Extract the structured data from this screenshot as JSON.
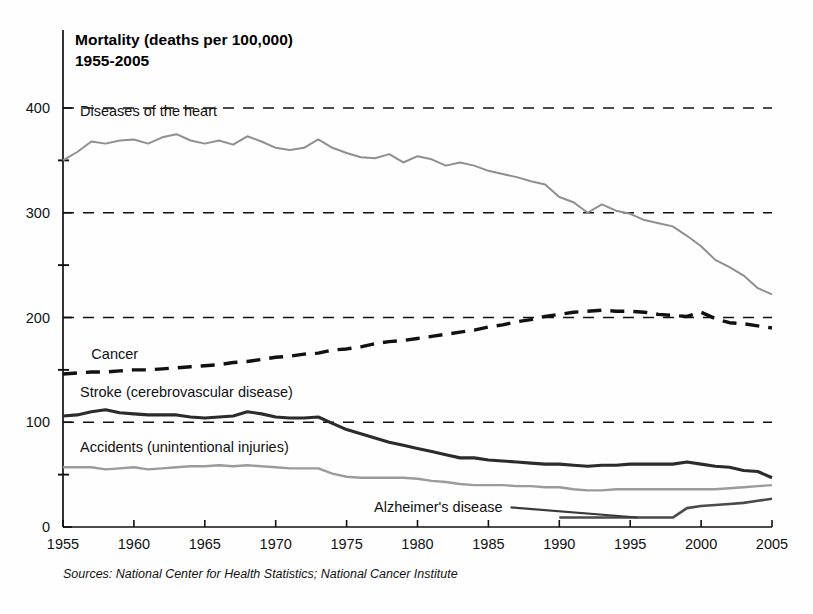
{
  "chart_data": {
    "type": "line",
    "title": "Mortality (deaths per 100,000)",
    "subtitle": "1955-2005",
    "xlabel": "",
    "ylabel": "",
    "xlim": [
      1955,
      2005
    ],
    "ylim": [
      0,
      400
    ],
    "grid": true,
    "grid_values": [
      100,
      200,
      300,
      400
    ],
    "legend_position": "inline-labels",
    "source_note": "Sources:  National Center for Health Statistics; National Cancer Institute",
    "xticks": [
      1955,
      1960,
      1965,
      1970,
      1975,
      1980,
      1985,
      1990,
      1995,
      2000,
      2005
    ],
    "xtick_labels": [
      "1955",
      "1960",
      "1965",
      "1970",
      "1975",
      "1980",
      "1985",
      "1990",
      "1995",
      "2000",
      "2005"
    ],
    "yticks": [
      0,
      100,
      200,
      300,
      400
    ],
    "ytick_labels": [
      "0",
      "100",
      "200",
      "300",
      "400"
    ],
    "yminor_ticks": [
      50,
      150,
      250,
      350
    ],
    "x": [
      1955,
      1956,
      1957,
      1958,
      1959,
      1960,
      1961,
      1962,
      1963,
      1964,
      1965,
      1966,
      1967,
      1968,
      1969,
      1970,
      1971,
      1972,
      1973,
      1974,
      1975,
      1976,
      1977,
      1978,
      1979,
      1980,
      1981,
      1982,
      1983,
      1984,
      1985,
      1986,
      1987,
      1988,
      1989,
      1990,
      1991,
      1992,
      1993,
      1994,
      1995,
      1996,
      1997,
      1998,
      1999,
      2000,
      2001,
      2002,
      2003,
      2004,
      2005
    ],
    "series": [
      {
        "name": "Diseases of the heart",
        "label": "Diseases of the heart",
        "color": "#8f8f8f",
        "style": "solid",
        "width": 2.0,
        "label_x": 1956.2,
        "label_y": 392,
        "values": [
          350,
          358,
          368,
          366,
          369,
          370,
          366,
          372,
          375,
          369,
          366,
          369,
          365,
          373,
          368,
          362,
          360,
          362,
          370,
          362,
          357,
          353,
          352,
          356,
          348,
          354,
          351,
          345,
          348,
          345,
          340,
          337,
          334,
          330,
          327,
          315,
          310,
          300,
          308,
          302,
          299,
          293,
          290,
          287,
          278,
          268,
          255,
          248,
          240,
          228,
          222
        ]
      },
      {
        "name": "Cancer",
        "label": "Cancer",
        "color": "#111111",
        "style": "dashed",
        "width": 3.4,
        "label_x": 1957.0,
        "label_y": 160,
        "values": [
          146,
          147,
          148,
          148,
          149,
          150,
          150,
          151,
          152,
          153,
          154,
          155,
          157,
          158,
          160,
          162,
          163,
          165,
          166,
          169,
          170,
          172,
          175,
          177,
          178,
          180,
          182,
          184,
          186,
          188,
          191,
          193,
          196,
          198,
          201,
          203,
          205,
          206,
          207,
          206,
          206,
          205,
          203,
          202,
          201,
          205,
          199,
          195,
          194,
          192,
          190
        ]
      },
      {
        "name": "Stroke (cerebrovascular disease)",
        "label": "Stroke (cerebrovascular disease)",
        "color": "#2b2b2b",
        "style": "solid",
        "width": 3.1,
        "label_x": 1956.2,
        "label_y": 124,
        "values": [
          106,
          107,
          110,
          112,
          109,
          108,
          107,
          107,
          107,
          105,
          104,
          105,
          106,
          110,
          108,
          105,
          104,
          104,
          105,
          99,
          93,
          89,
          85,
          81,
          78,
          75,
          72,
          69,
          66,
          66,
          64,
          63,
          62,
          61,
          60,
          60,
          59,
          58,
          59,
          59,
          60,
          60,
          60,
          60,
          62,
          60,
          58,
          57,
          54,
          53,
          47
        ]
      },
      {
        "name": "Accidents (unintentional injuries)",
        "label": "Accidents (unintentional injuries)",
        "color": "#9b9b9b",
        "style": "solid",
        "width": 2.4,
        "label_x": 1956.2,
        "label_y": 72,
        "values": [
          57,
          57,
          57,
          55,
          56,
          57,
          55,
          56,
          57,
          58,
          58,
          59,
          58,
          59,
          58,
          57,
          56,
          56,
          56,
          51,
          48,
          47,
          47,
          47,
          47,
          46,
          44,
          43,
          41,
          40,
          40,
          40,
          39,
          39,
          38,
          38,
          36,
          35,
          35,
          36,
          36,
          36,
          36,
          36,
          36,
          36,
          36,
          37,
          38,
          39,
          40
        ]
      },
      {
        "name": "Alzheimer's disease",
        "label": "Alzheimer's disease",
        "color": "#4a4a4a",
        "style": "solid",
        "width": 2.6,
        "label_x": 1986.0,
        "label_y": 14,
        "values": [
          null,
          null,
          null,
          null,
          null,
          null,
          null,
          null,
          null,
          null,
          null,
          null,
          null,
          null,
          null,
          null,
          null,
          null,
          null,
          null,
          null,
          null,
          null,
          null,
          null,
          null,
          null,
          null,
          null,
          null,
          null,
          null,
          null,
          null,
          null,
          9,
          9,
          9,
          9,
          9,
          9,
          9,
          9,
          9,
          18,
          20,
          21,
          22,
          23,
          25,
          27
        ]
      }
    ]
  }
}
